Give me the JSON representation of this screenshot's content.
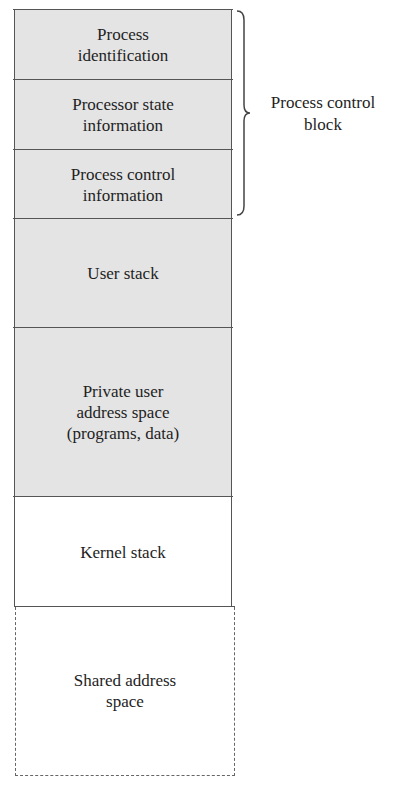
{
  "diagram": {
    "segments": [
      {
        "label": "Process\nidentification",
        "fill": "#e4e4e4"
      },
      {
        "label": "Processor state\ninformation",
        "fill": "#e4e4e4"
      },
      {
        "label": "Process control\ninformation",
        "fill": "#e4e4e4"
      },
      {
        "label": "User stack",
        "fill": "#e4e4e4"
      },
      {
        "label": "Private user\naddress space\n(programs, data)",
        "fill": "#e4e4e4"
      },
      {
        "label": "Kernel stack",
        "fill": "#ffffff"
      },
      {
        "label": "Shared address\nspace",
        "fill": "#ffffff",
        "border": "dashed"
      }
    ],
    "brace_label": "Process control\nblock",
    "brace_spans": [
      "Process identification",
      "Processor state information",
      "Process control information"
    ]
  }
}
